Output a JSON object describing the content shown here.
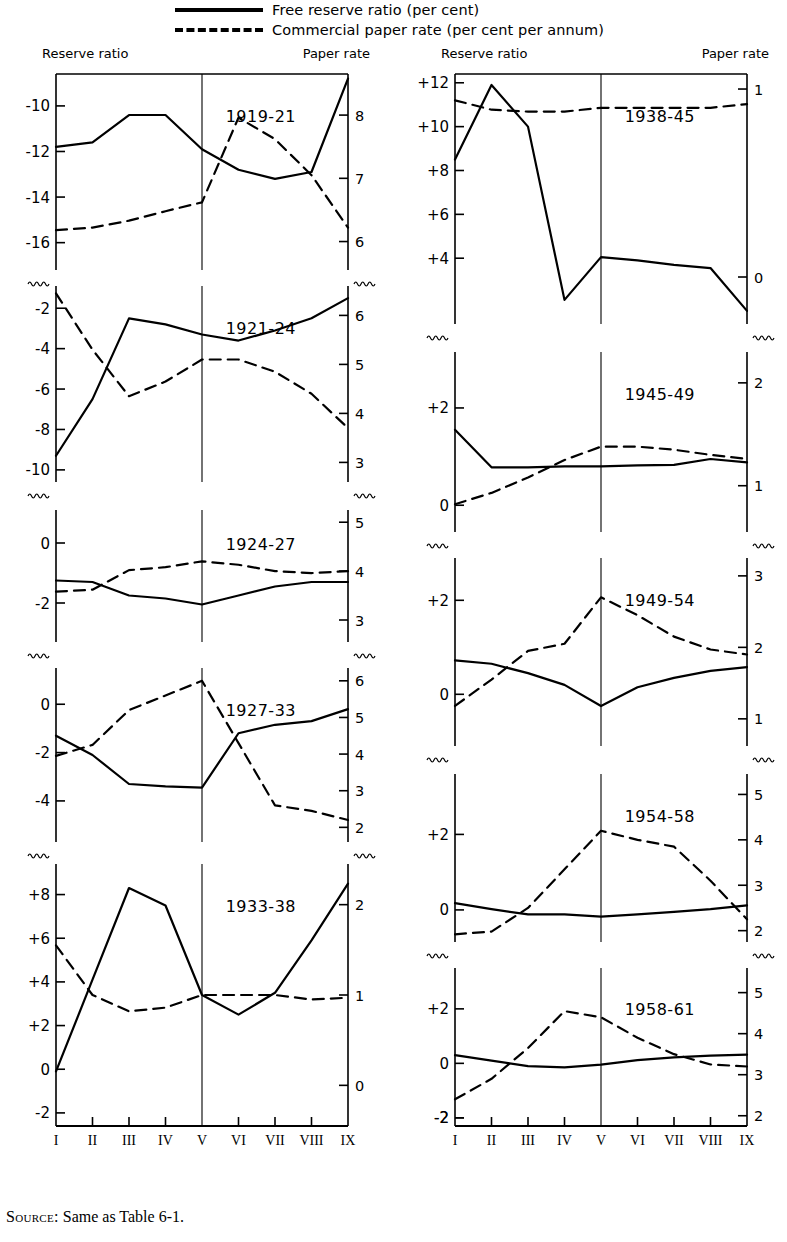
{
  "legend": {
    "items": [
      {
        "style": "solid",
        "label": "Free reserve ratio (per cent)"
      },
      {
        "style": "dashed",
        "label": "Commercial paper rate (per cent per annum)"
      }
    ]
  },
  "axis_captions": {
    "left": "Reserve ratio",
    "right": "Paper rate"
  },
  "source_note": {
    "prefix": "Source:",
    "text": " Same as Table 6-1."
  },
  "x_tick_labels": [
    "I",
    "II",
    "III",
    "IV",
    "V",
    "VI",
    "VII",
    "VIII",
    "IX"
  ],
  "chart_data": {
    "type": "line",
    "subtitle": "",
    "xlabel": "",
    "ylabel": "",
    "grid": false,
    "legend_position": "top",
    "x": [
      "I",
      "II",
      "III",
      "IV",
      "V",
      "VI",
      "VII",
      "VIII",
      "IX"
    ],
    "series_names": [
      "Free reserve ratio (per cent)",
      "Commercial paper rate (per cent per annum)"
    ],
    "panels": [
      {
        "title": "1919-21",
        "column": "left",
        "left_axis_label": "Reserve ratio",
        "right_axis_label": "Paper rate",
        "left_ticks": [
          -10,
          -12,
          -14,
          -16
        ],
        "right_ticks": [
          8,
          7,
          6
        ],
        "left_range": [
          -17.2,
          -8.6
        ],
        "right_range": [
          5.55,
          8.65
        ],
        "reserve_ratio": [
          -11.8,
          -11.6,
          -10.4,
          -10.4,
          -11.9,
          -12.8,
          -13.2,
          -12.9,
          -8.8
        ],
        "paper_rate": [
          6.18,
          6.22,
          6.33,
          6.48,
          6.62,
          7.96,
          7.62,
          7.05,
          6.22
        ]
      },
      {
        "title": "1921-24",
        "column": "left",
        "left_ticks": [
          -2,
          -4,
          -6,
          -8,
          -10
        ],
        "right_ticks": [
          6,
          5,
          4,
          3
        ],
        "left_range": [
          -10.6,
          -0.9
        ],
        "right_range": [
          2.6,
          6.6
        ],
        "reserve_ratio": [
          -9.3,
          -6.5,
          -2.5,
          -2.8,
          -3.3,
          -3.6,
          -3.1,
          -2.5,
          -1.5
        ],
        "paper_rate": [
          6.45,
          5.3,
          4.35,
          4.65,
          5.1,
          5.1,
          4.85,
          4.4,
          3.7
        ]
      },
      {
        "title": "1924-27",
        "column": "left",
        "left_ticks": [
          0,
          -2
        ],
        "right_ticks": [
          5,
          4,
          3
        ],
        "left_range": [
          -3.3,
          1.1
        ],
        "right_range": [
          2.55,
          5.25
        ],
        "reserve_ratio": [
          -1.25,
          -1.3,
          -1.75,
          -1.85,
          -2.05,
          -1.75,
          -1.45,
          -1.3,
          -1.3
        ],
        "paper_rate": [
          3.58,
          3.62,
          4.02,
          4.08,
          4.2,
          4.13,
          4.0,
          3.96,
          4.0
        ]
      },
      {
        "title": "1927-33",
        "column": "left",
        "left_ticks": [
          0,
          -2,
          -4
        ],
        "right_ticks": [
          6,
          5,
          4,
          3,
          2
        ],
        "left_range": [
          -5.7,
          1.5
        ],
        "right_range": [
          1.6,
          6.35
        ],
        "reserve_ratio": [
          -1.3,
          -2.1,
          -3.3,
          -3.4,
          -3.45,
          -1.2,
          -0.85,
          -0.7,
          -0.2
        ],
        "paper_rate": [
          3.95,
          4.25,
          5.2,
          5.6,
          6.0,
          4.3,
          2.6,
          2.45,
          2.2
        ]
      },
      {
        "title": "1933-38",
        "column": "left",
        "left_ticks": [
          8,
          6,
          4,
          2,
          0,
          -2
        ],
        "right_ticks": [
          2,
          1,
          0
        ],
        "left_range": [
          -2.6,
          9.4
        ],
        "right_range": [
          -0.45,
          2.45
        ],
        "reserve_ratio": [
          -0.1,
          4.1,
          8.3,
          7.5,
          3.4,
          2.5,
          3.5,
          5.9,
          8.5
        ],
        "paper_rate": [
          1.55,
          1.0,
          0.82,
          0.86,
          1.0,
          1.0,
          1.0,
          0.95,
          0.97
        ]
      },
      {
        "title": "1938-45",
        "column": "right",
        "left_axis_label": "Reserve ratio",
        "right_axis_label": "Paper rate",
        "left_ticks": [
          12,
          10,
          8,
          6,
          4
        ],
        "right_ticks": [
          1,
          0
        ],
        "left_range": [
          1.0,
          12.4
        ],
        "right_range": [
          -0.25,
          1.08
        ],
        "reserve_ratio": [
          8.5,
          11.9,
          10.0,
          2.1,
          4.05,
          3.9,
          3.7,
          3.55,
          1.6
        ],
        "paper_rate": [
          0.94,
          0.89,
          0.88,
          0.88,
          0.9,
          0.9,
          0.9,
          0.9,
          0.92
        ]
      },
      {
        "title": "1945-49",
        "column": "right",
        "left_ticks": [
          2,
          0
        ],
        "right_ticks": [
          2,
          1,
          0
        ],
        "left_range": [
          -0.55,
          3.15
        ],
        "right_range": [
          0.55,
          2.3
        ],
        "reserve_ratio": [
          1.55,
          0.78,
          0.78,
          0.8,
          0.8,
          0.82,
          0.83,
          0.95,
          0.88
        ],
        "paper_rate": [
          0.82,
          0.93,
          1.08,
          1.25,
          1.38,
          1.38,
          1.35,
          1.3,
          1.26
        ]
      },
      {
        "title": "1949-54",
        "column": "right",
        "left_ticks": [
          2,
          0
        ],
        "right_ticks": [
          3,
          2,
          1
        ],
        "left_range": [
          -1.1,
          2.9
        ],
        "right_range": [
          0.62,
          3.25
        ],
        "reserve_ratio": [
          0.72,
          0.65,
          0.45,
          0.2,
          -0.25,
          0.15,
          0.35,
          0.5,
          0.58
        ],
        "paper_rate": [
          1.18,
          1.55,
          1.95,
          2.05,
          2.7,
          2.45,
          2.15,
          1.97,
          1.9
        ]
      },
      {
        "title": "1954-58",
        "column": "right",
        "left_ticks": [
          -2,
          2,
          0
        ],
        "right_ticks": [
          5,
          4,
          3,
          2
        ],
        "left_range": [
          -0.85,
          3.6
        ],
        "right_range": [
          1.75,
          5.45
        ],
        "reserve_ratio": [
          0.18,
          0.02,
          -0.12,
          -0.12,
          -0.18,
          -0.12,
          -0.05,
          0.02,
          0.12
        ],
        "paper_rate": [
          1.92,
          1.98,
          2.5,
          3.35,
          4.2,
          4.0,
          3.85,
          3.1,
          2.25
        ]
      },
      {
        "title": "1958-61",
        "column": "right",
        "left_ticks": [
          -2,
          2,
          0,
          -2
        ],
        "right_ticks": [
          1,
          5,
          4,
          3,
          2
        ],
        "left_range": [
          -2.3,
          3.5
        ],
        "right_range": [
          1.75,
          5.6
        ],
        "reserve_ratio": [
          0.3,
          0.1,
          -0.1,
          -0.15,
          -0.05,
          0.12,
          0.22,
          0.28,
          0.32
        ],
        "paper_rate": [
          2.4,
          2.9,
          3.65,
          4.55,
          4.4,
          3.9,
          3.5,
          3.25,
          3.2
        ]
      }
    ]
  }
}
